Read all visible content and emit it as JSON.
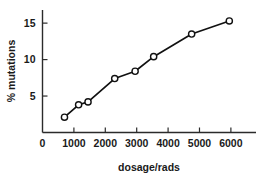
{
  "chart_data": {
    "type": "line",
    "title": "",
    "xlabel": "dosage/rads",
    "ylabel": "% mutations",
    "xlim": [
      0,
      6800
    ],
    "ylim": [
      0,
      16.8
    ],
    "grid": false,
    "legend": "none",
    "marker": "open-circle",
    "xticks": [
      0,
      1000,
      2000,
      3000,
      4000,
      5000,
      6000
    ],
    "xtick_labels": [
      "0",
      "1000",
      "2000",
      "3000",
      "4000",
      "5000",
      "6000"
    ],
    "yticks": [
      5,
      10,
      15
    ],
    "ytick_labels": [
      "5",
      "10",
      "15"
    ],
    "x": [
      700,
      1150,
      1450,
      2300,
      2950,
      3540,
      4750,
      5950
    ],
    "values": [
      2.1,
      3.8,
      4.2,
      7.4,
      8.4,
      10.4,
      13.5,
      15.3
    ],
    "points": [
      {
        "dosage": 700,
        "mutations": 2.1
      },
      {
        "dosage": 1150,
        "mutations": 3.8
      },
      {
        "dosage": 1450,
        "mutations": 4.2
      },
      {
        "dosage": 2300,
        "mutations": 7.4
      },
      {
        "dosage": 2950,
        "mutations": 8.4
      },
      {
        "dosage": 3540,
        "mutations": 10.4
      },
      {
        "dosage": 4750,
        "mutations": 13.5
      },
      {
        "dosage": 5950,
        "mutations": 15.3
      }
    ],
    "colors": {
      "line": "#111111",
      "marker_fill": "#ffffff",
      "marker_stroke": "#111111",
      "axis": "#2b2b2b",
      "text": "#1a1a1a",
      "background": "#ffffff"
    }
  }
}
